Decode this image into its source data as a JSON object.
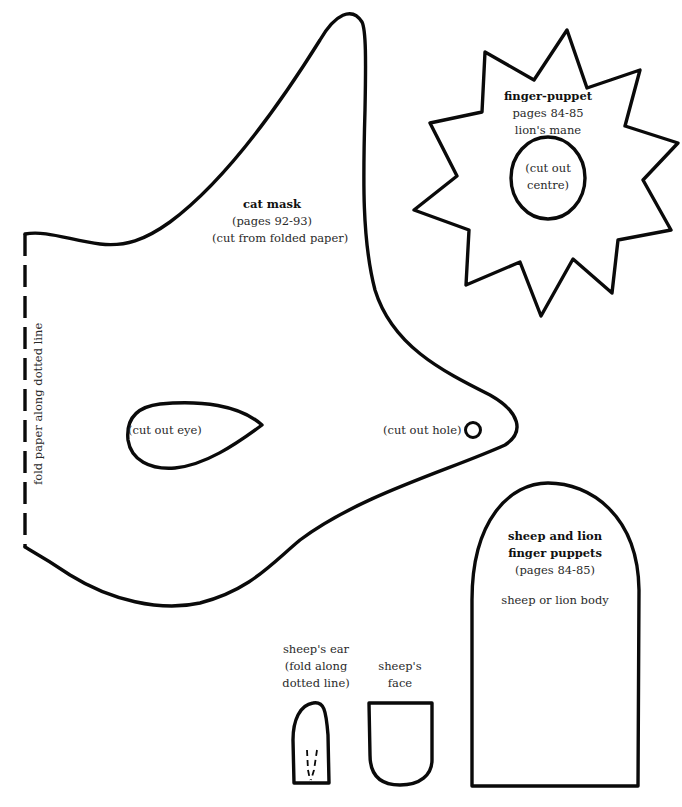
{
  "cat_mask": {
    "title": "cat mask",
    "pages": "(pages 92-93)",
    "instruction": "(cut from folded paper)",
    "fold_instruction": "fold paper along dotted line",
    "eye_label": "(cut out eye)",
    "hole_label": "(cut out hole)"
  },
  "lion_mane": {
    "title": "finger-puppet",
    "pages": "pages 84-85",
    "subtitle": "lion's mane",
    "centre_line1": "(cut out",
    "centre_line2": "centre)"
  },
  "puppet_body": {
    "title_line1": "sheep and lion",
    "title_line2": "finger puppets",
    "pages": "(pages 84-85)",
    "description": "sheep or lion body"
  },
  "sheep_ear": {
    "line1": "sheep's ear",
    "line2": "(fold along",
    "line3": "dotted line)"
  },
  "sheep_face": {
    "line1": "sheep's",
    "line2": "face"
  },
  "colors": {
    "outline": "#0a0a0a",
    "text": "#2a2a2a",
    "background": "#ffffff"
  }
}
